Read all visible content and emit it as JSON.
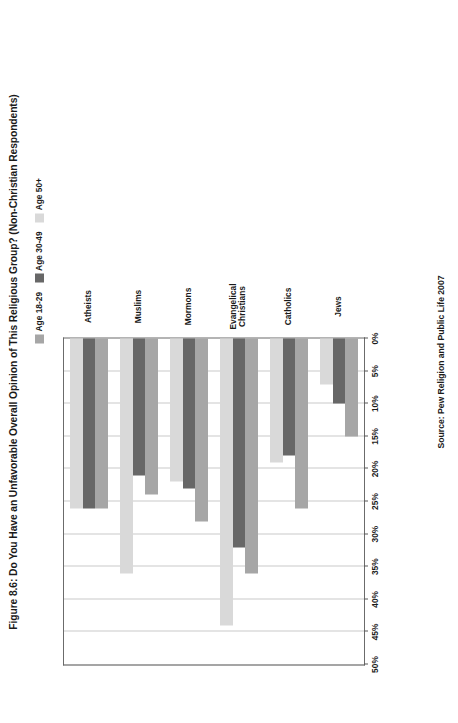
{
  "figure": {
    "title": "Figure 8.6: Do You Have an Unfavorable Overall Opinion of This Religious Group? (Non-Christian Respondents)",
    "source": "Source: Pew Religion and Public Life 2007"
  },
  "legend": {
    "entries": [
      {
        "label": "Age 18-29",
        "color": "#a6a6a6"
      },
      {
        "label": "Age 30-49",
        "color": "#676767"
      },
      {
        "label": "Age 50+",
        "color": "#d9d9d9"
      }
    ]
  },
  "axis": {
    "ticks": [
      "50%",
      "45%",
      "40%",
      "35%",
      "30%",
      "25%",
      "20%",
      "15%",
      "10%",
      "5%",
      "0%"
    ]
  },
  "chart_data": {
    "type": "bar",
    "title": "Figure 8.6: Do You Have an Unfavorable Overall Opinion of This Religious Group? (Non-Christian Respondents)",
    "orientation": "horizontal",
    "categories": [
      "Jews",
      "Catholics",
      "Evangelical\nChristians",
      "Mormons",
      "Muslims",
      "Atheists"
    ],
    "series": [
      {
        "name": "Age 18-29",
        "color": "#a6a6a6",
        "values": [
          15,
          26,
          36,
          28,
          24,
          26
        ]
      },
      {
        "name": "Age 30-49",
        "color": "#676767",
        "values": [
          10,
          18,
          32,
          23,
          21,
          26
        ]
      },
      {
        "name": "Age 50+",
        "color": "#d9d9d9",
        "values": [
          7,
          19,
          44,
          22,
          36,
          26
        ]
      }
    ],
    "xlabel": "",
    "ylabel": "",
    "xlim": [
      0,
      50
    ],
    "tick_step": 5,
    "grid": true,
    "legend_position": "top-right",
    "source": "Source: Pew Religion and Public Life 2007"
  }
}
